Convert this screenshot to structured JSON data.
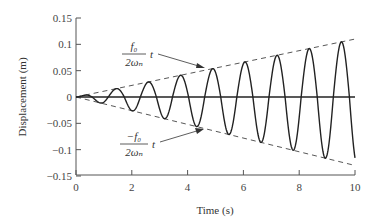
{
  "chart_data": {
    "type": "line",
    "title": "",
    "xlabel": "Time (s)",
    "ylabel": "Displacement (m)",
    "xlim": [
      0,
      10
    ],
    "ylim": [
      -0.15,
      0.15
    ],
    "xticks": [
      "0",
      "2",
      "4",
      "6",
      "8",
      "10"
    ],
    "yticks": [
      "0.15",
      "0.1",
      "0.05",
      "0",
      "−0.05",
      "−0.1",
      "−0.15"
    ],
    "grid": false,
    "legend": null,
    "series": [
      {
        "name": "response x(t) = (f0/2ωn) t sin(ωn t)",
        "style": "solid",
        "omega_n": 5.45,
        "amplitude_slope": 0.011,
        "x": [
          0,
          1.15,
          1.44,
          2.3,
          2.88,
          3.46,
          4.6,
          5.2,
          5.76,
          6.9,
          7.5,
          8.6,
          9.2,
          10
        ],
        "values": [
          0,
          0.012,
          -0.016,
          0.028,
          -0.032,
          0.04,
          -0.06,
          0.06,
          -0.063,
          0.075,
          -0.085,
          0.095,
          -0.12,
          0.11
        ]
      },
      {
        "name": "upper envelope (f0/2ωn) t",
        "style": "dashed",
        "x": [
          0,
          10
        ],
        "values": [
          0,
          0.11
        ]
      },
      {
        "name": "lower envelope −(f0/2ωn) t",
        "style": "dashed",
        "x": [
          0,
          10
        ],
        "values": [
          0,
          -0.13
        ]
      },
      {
        "name": "zero line",
        "style": "solid",
        "x": [
          0,
          10
        ],
        "values": [
          0,
          0
        ]
      }
    ],
    "annotations": [
      {
        "text_num": "f₀",
        "text_den": "2ωₙ",
        "suffix": "t",
        "points_to": "upper envelope"
      },
      {
        "text_num": "−f₀",
        "text_den": "2ωₙ",
        "suffix": "t",
        "points_to": "lower envelope"
      }
    ]
  },
  "labels": {
    "xlabel": "Time (s)",
    "ylabel": "Displacement (m)",
    "upper_num": "f₀",
    "upper_den": "2ωₙ",
    "upper_t": "t",
    "lower_num": "−f₀",
    "lower_den": "2ωₙ",
    "lower_t": "t"
  }
}
